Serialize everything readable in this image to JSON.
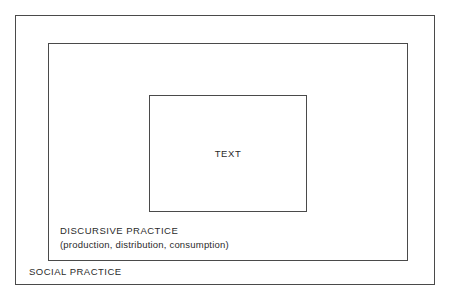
{
  "diagram": {
    "type": "nested-boxes",
    "background_color": "#ffffff",
    "border_color": "#4a4a4a",
    "text_color": "#2b2b2b",
    "layers": {
      "outer": {
        "label": "SOCIAL PRACTICE"
      },
      "middle": {
        "label": "DISCURSIVE PRACTICE",
        "sublabel": "(production, distribution, consumption)"
      },
      "inner": {
        "label": "TEXT"
      }
    }
  }
}
